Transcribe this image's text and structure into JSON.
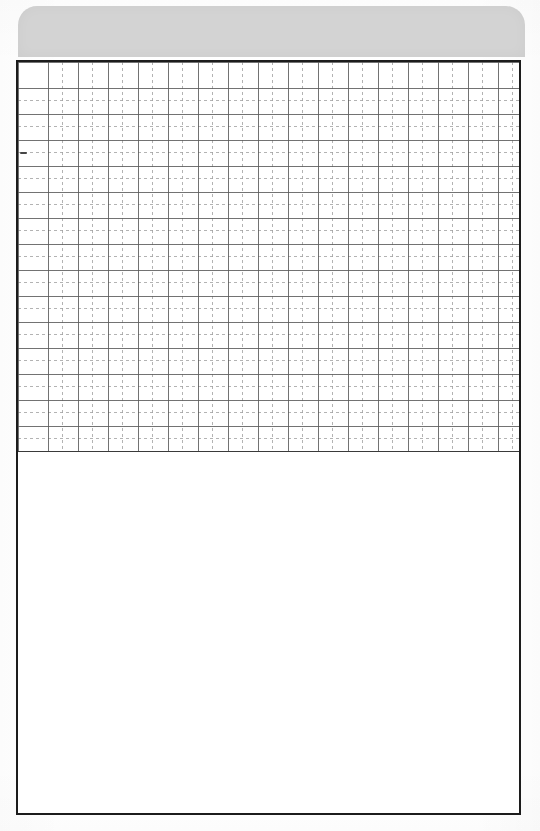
{
  "document": {
    "title": "Scanned grid form page",
    "page_width": 540,
    "page_height": 831,
    "background_color": "#ffffff"
  },
  "header_band": {
    "name": "header-band",
    "label": "",
    "fill_color": "#d3d3d3",
    "x": 18,
    "y": 6,
    "width": 507,
    "height": 51,
    "corner_radius": 19,
    "rounded_corners": "top-left, top-right"
  },
  "form_frame": {
    "name": "form-frame",
    "border_color": "#1c1c1c",
    "border_width": 2,
    "x": 16,
    "y": 60,
    "width": 505,
    "height": 755,
    "fill_color": "#ffffff"
  },
  "grid_region": {
    "name": "graph-paper-grid",
    "x": 18,
    "y": 62,
    "width": 501,
    "height": 390,
    "major_line_color": "#5a5a5a",
    "minor_line_color": "#a0a0a0",
    "major_line_style": "solid",
    "minor_line_style": "dashed",
    "major_cell_width": 30,
    "major_cell_height": 26,
    "minor_subdivision": 2,
    "major_columns": 17,
    "major_rows": 15,
    "bottom_rule_color": "#3a3a3a"
  },
  "blank_region": {
    "name": "blank-writing-area",
    "x": 18,
    "y": 452,
    "width": 501,
    "height": 361,
    "fill_color": "#ffffff",
    "content": ""
  },
  "artifacts": {
    "scan_speck": {
      "name": "scan-speck",
      "x": 20,
      "y": 152,
      "width": 7,
      "height": 2,
      "color": "#464646"
    }
  }
}
